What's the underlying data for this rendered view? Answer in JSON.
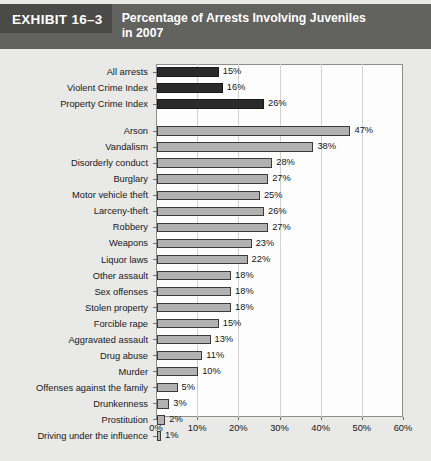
{
  "header": {
    "exhibit_label": "EXHIBIT 16–3",
    "title": "Percentage of Arrests Involving Juveniles in 2007",
    "band_color": "#62625f",
    "exhibit_box_color": "#4a4a48",
    "text_color": "#ffffff"
  },
  "chart_data": {
    "type": "bar",
    "orientation": "horizontal",
    "title": "Percentage of Arrests Involving Juveniles in 2007",
    "xlabel": "",
    "ylabel": "",
    "xlim": [
      0,
      60
    ],
    "xtick_labels": [
      "0%",
      "10%",
      "20%",
      "30%",
      "40%",
      "50%",
      "60%"
    ],
    "xticks": [
      0,
      10,
      20,
      30,
      40,
      50,
      60
    ],
    "grid": "vertical",
    "legend": "none",
    "value_suffix": "%",
    "series_colors": {
      "summary_bar": "#2b2b2b",
      "offense_bar": "#b2b2b2",
      "bar_outline": "#3b3b3b"
    },
    "groups": [
      {
        "name": "summary",
        "style": "dark",
        "categories": [
          "All arrests",
          "Violent Crime Index",
          "Property Crime Index"
        ],
        "values": [
          15,
          16,
          26
        ],
        "labels": [
          "15%",
          "16%",
          "26%"
        ]
      },
      {
        "name": "offenses",
        "style": "light",
        "categories": [
          "Arson",
          "Vandalism",
          "Disorderly conduct",
          "Burglary",
          "Motor vehicle theft",
          "Larceny-theft",
          "Robbery",
          "Weapons",
          "Liquor laws",
          "Other assault",
          "Sex offenses",
          "Stolen property",
          "Forcible rape",
          "Aggravated assault",
          "Drug abuse",
          "Murder",
          "Offenses against the family",
          "Drunkenness",
          "Prostitution",
          "Driving under the influence"
        ],
        "values": [
          47,
          38,
          28,
          27,
          25,
          26,
          27,
          23,
          22,
          18,
          18,
          18,
          15,
          13,
          11,
          10,
          5,
          3,
          2,
          1
        ],
        "labels": [
          "47%",
          "38%",
          "28%",
          "27%",
          "25%",
          "26%",
          "27%",
          "23%",
          "22%",
          "18%",
          "18%",
          "18%",
          "15%",
          "13%",
          "11%",
          "10%",
          "5%",
          "3%",
          "2%",
          "1%"
        ]
      }
    ],
    "categories": [
      "All arrests",
      "Violent Crime Index",
      "Property Crime Index",
      "Arson",
      "Vandalism",
      "Disorderly conduct",
      "Burglary",
      "Motor vehicle theft",
      "Larceny-theft",
      "Robbery",
      "Weapons",
      "Liquor laws",
      "Other assault",
      "Sex offenses",
      "Stolen property",
      "Forcible rape",
      "Aggravated assault",
      "Drug abuse",
      "Murder",
      "Offenses against the family",
      "Drunkenness",
      "Prostitution",
      "Driving under the influence"
    ],
    "values": [
      15,
      16,
      26,
      47,
      38,
      28,
      27,
      25,
      26,
      27,
      23,
      22,
      18,
      18,
      18,
      15,
      13,
      11,
      10,
      5,
      3,
      2,
      1
    ]
  }
}
